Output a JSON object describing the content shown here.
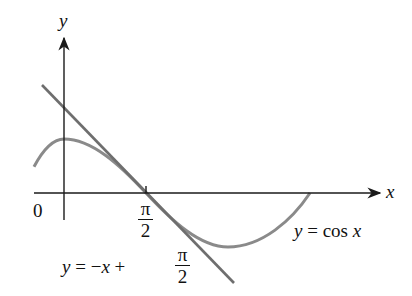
{
  "figure": {
    "axes": {
      "x_label": "x",
      "y_label": "y",
      "origin_label": "0"
    },
    "tick": {
      "numerator": "π",
      "denominator": "2"
    },
    "curve_label": {
      "lhs": "y",
      "eq": " = cos ",
      "var": "x"
    },
    "tangent_label": {
      "lhs": "y",
      "eq": " = −",
      "var": "x",
      "plus": " + ",
      "numerator": "π",
      "denominator": "2"
    },
    "colors": {
      "curve": "#8a8a8a",
      "tangent": "#6e6e6e",
      "axes": "#1a1a1a"
    }
  }
}
